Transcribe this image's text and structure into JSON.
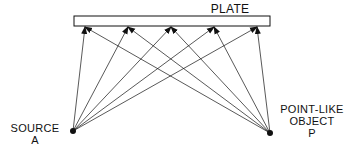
{
  "diagram": {
    "plate_label": "PLATE",
    "source_label_line1": "SOURCE",
    "source_label_line2": "A",
    "object_label_line1": "POINT-LIKE",
    "object_label_line2": "OBJECT",
    "object_label_line3": "P",
    "arrow_count_per_point": 5,
    "colors": {
      "stroke": "#111111",
      "background": "#ffffff"
    }
  }
}
